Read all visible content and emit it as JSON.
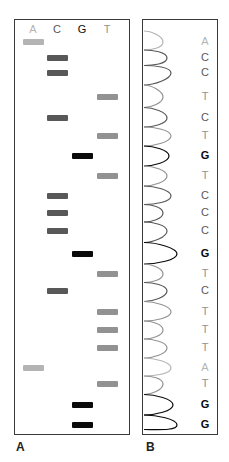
{
  "panelA": {
    "label": "A",
    "lanes": [
      {
        "base": "A",
        "color": "#b4b4b4",
        "x": 8
      },
      {
        "base": "C",
        "color": "#585858",
        "x": 32
      },
      {
        "base": "G",
        "color": "#0a0a0a",
        "x": 57
      },
      {
        "base": "T",
        "color": "#929292",
        "x": 82
      }
    ]
  },
  "panelB": {
    "label": "B"
  },
  "sequence": [
    "A",
    "C",
    "C",
    "T",
    "C",
    "T",
    "G",
    "T",
    "C",
    "C",
    "C",
    "G",
    "T",
    "C",
    "T",
    "T",
    "T",
    "A",
    "T",
    "G",
    "G"
  ],
  "band_y": [
    41,
    57,
    72,
    96,
    117,
    135,
    155,
    175,
    195,
    212,
    230,
    253,
    273,
    290,
    311,
    329,
    347,
    367,
    383,
    404,
    424
  ],
  "colors": {
    "A": "#b4b4b4",
    "C": "#585858",
    "G": "#0a0a0a",
    "T": "#929292"
  }
}
